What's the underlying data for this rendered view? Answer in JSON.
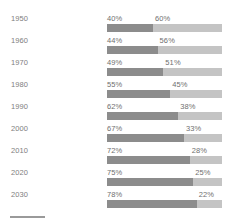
{
  "chart_data": {
    "type": "bar",
    "title": "",
    "subtitle": "",
    "xlabel": "",
    "ylabel": "",
    "xlim": [
      0,
      100
    ],
    "grid": false,
    "legend_position": "none",
    "orientation": "horizontal",
    "stacked": true,
    "stacked_total": 100,
    "value_suffix": "%",
    "categories": [
      "1950",
      "1960",
      "1970",
      "1980",
      "1990",
      "2000",
      "2010",
      "2020",
      "2030"
    ],
    "series": [
      {
        "name": "primary",
        "color": "#8c8c8c",
        "values": [
          40,
          44,
          49,
          55,
          62,
          67,
          72,
          75,
          78
        ],
        "labels": [
          "40%",
          "44%",
          "49%",
          "55%",
          "62%",
          "67%",
          "72%",
          "75%",
          "78%"
        ]
      },
      {
        "name": "secondary",
        "color": "#c4c4c4",
        "values": [
          60,
          56,
          51,
          45,
          38,
          33,
          28,
          25,
          22
        ],
        "labels": [
          "60%",
          "56%",
          "51%",
          "45%",
          "38%",
          "33%",
          "28%",
          "25%",
          "22%"
        ]
      }
    ]
  },
  "rows": [
    {
      "year": "1950",
      "left_label": "40%",
      "right_label": "60%",
      "left_value": 40,
      "right_value": 60
    },
    {
      "year": "1960",
      "left_label": "44%",
      "right_label": "56%",
      "left_value": 44,
      "right_value": 56
    },
    {
      "year": "1970",
      "left_label": "49%",
      "right_label": "51%",
      "left_value": 49,
      "right_value": 51
    },
    {
      "year": "1980",
      "left_label": "55%",
      "right_label": "45%",
      "left_value": 55,
      "right_value": 45
    },
    {
      "year": "1990",
      "left_label": "62%",
      "right_label": "38%",
      "left_value": 62,
      "right_value": 38
    },
    {
      "year": "2000",
      "left_label": "67%",
      "right_label": "33%",
      "left_value": 67,
      "right_value": 33
    },
    {
      "year": "2010",
      "left_label": "72%",
      "right_label": "28%",
      "left_value": 72,
      "right_value": 28
    },
    {
      "year": "2020",
      "left_label": "75%",
      "right_label": "25%",
      "left_value": 75,
      "right_value": 25
    },
    {
      "year": "2030",
      "left_label": "78%",
      "right_label": "22%",
      "left_value": 78,
      "right_value": 22
    }
  ],
  "colors": {
    "primary": "#8c8c8c",
    "secondary": "#c4c4c4",
    "label_text": "#6f6f6f",
    "year_text": "#7e7e7e",
    "background": "#ffffff",
    "footer_rule": "#9a9a9a"
  },
  "layout": {
    "row_height": 22,
    "first_row_top": 12,
    "bar_left": 107,
    "bar_width": 115,
    "bar_height": 8
  }
}
